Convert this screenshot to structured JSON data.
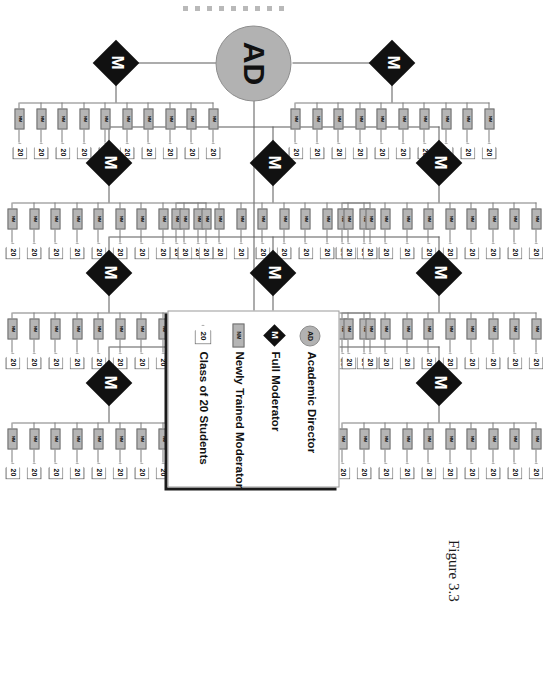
{
  "figure": {
    "caption": "Figure 3.3",
    "scan_marks": 9
  },
  "root": {
    "id": "AD",
    "label": "AD",
    "role": "Academic Director"
  },
  "node_labels": {
    "moderator": "M",
    "newly_trained_moderator": "NM",
    "class": "20"
  },
  "legend": {
    "items": [
      {
        "key": "AD",
        "icon": "circle-gray-ad-icon",
        "label": "Academic Director"
      },
      {
        "key": "M",
        "icon": "diamond-black-m-icon",
        "label": "Full Moderator"
      },
      {
        "key": "NM",
        "icon": "box-gray-nm-icon",
        "label": "Newly Trained Moderator"
      },
      {
        "key": "20",
        "icon": "pentagon-class-icon",
        "label": "Class of 20 Students"
      }
    ]
  },
  "tree": {
    "description": "Academic Director supervises 10 Full Moderators; each Full Moderator supervises 10 Newly Trained Moderators; each Newly Trained Moderator runs one Class of 20 Students.",
    "moderator_count": 10,
    "nm_per_moderator": 10,
    "students_per_class": 20,
    "columns": [
      {
        "name": "column-1",
        "moderators": 2,
        "nm_counts": [
          10,
          10
        ]
      },
      {
        "name": "column-2",
        "moderators": 3,
        "nm_counts": [
          10,
          10,
          10
        ]
      },
      {
        "name": "column-3",
        "moderators": 3,
        "nm_counts": [
          10,
          10,
          10
        ]
      },
      {
        "name": "column-4",
        "moderators": 2,
        "nm_counts": [
          10,
          10
        ]
      }
    ]
  },
  "colors": {
    "ad_fill": "#b2b2b2",
    "moderator_fill": "#111111",
    "nm_fill": "#b5b5b5",
    "class_fill": "#ffffff",
    "line": "#5a5a5a",
    "scan_mark": "#b9b9b9"
  }
}
